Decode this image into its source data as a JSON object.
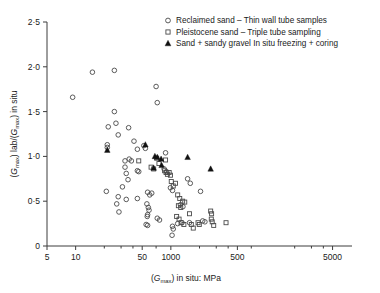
{
  "chart_data": {
    "type": "scatter",
    "title": "",
    "xlabel": "(Gmax) in situ: MPa",
    "ylabel": "(Gmax) lab/(Gmax) in situ",
    "xscale": "log",
    "yscale": "linear",
    "xlim": [
      5,
      8000
    ],
    "ylim": [
      0,
      2.5
    ],
    "grid": false,
    "legend_position": "top-right",
    "xticks_major": [
      {
        "value": 5,
        "label": "5"
      },
      {
        "value": 10,
        "label": "10"
      },
      {
        "value": 50,
        "label": "50"
      },
      {
        "value": 100,
        "label": "1000"
      },
      {
        "value": 500,
        "label": "500"
      },
      {
        "value": 5000,
        "label": "5000"
      }
    ],
    "xticks_minor": [
      20,
      30,
      40,
      70,
      200,
      300,
      400,
      700,
      2000,
      3000,
      4000
    ],
    "yticks": [
      {
        "value": 0,
        "label": "0"
      },
      {
        "value": 0.5,
        "label": "0·5"
      },
      {
        "value": 1.0,
        "label": "1·0"
      },
      {
        "value": 1.5,
        "label": "1·5"
      },
      {
        "value": 2.0,
        "label": "2·0"
      },
      {
        "value": 2.5,
        "label": "2·5"
      }
    ],
    "series": [
      {
        "name": "Reclaimed sand – Thin wall tube samples",
        "marker": "circle",
        "filled": false,
        "color": "#4a4a4a",
        "points": [
          [
            9.3,
            1.66
          ],
          [
            15.0,
            1.94
          ],
          [
            25.5,
            1.96
          ],
          [
            22.0,
            1.33
          ],
          [
            26.5,
            1.37
          ],
          [
            25.5,
            1.5
          ],
          [
            28.0,
            1.24
          ],
          [
            36.0,
            1.32
          ],
          [
            41.0,
            1.17
          ],
          [
            44.5,
            1.08
          ],
          [
            52.0,
            1.12
          ],
          [
            54.0,
            1.09
          ],
          [
            21.5,
            1.13
          ],
          [
            21.5,
            1.1
          ],
          [
            70.0,
            1.78
          ],
          [
            72.0,
            1.6
          ],
          [
            33.0,
            0.95
          ],
          [
            36.5,
            0.97
          ],
          [
            38.5,
            0.95
          ],
          [
            33.0,
            0.88
          ],
          [
            34.0,
            0.81
          ],
          [
            35.5,
            0.74
          ],
          [
            44.5,
            0.84
          ],
          [
            46.0,
            0.83
          ],
          [
            88.0,
            1.04
          ],
          [
            21.0,
            0.61
          ],
          [
            28.0,
            0.55
          ],
          [
            27.0,
            0.47
          ],
          [
            28.5,
            0.38
          ],
          [
            34.0,
            0.52
          ],
          [
            31.0,
            0.66
          ],
          [
            44.5,
            0.53
          ],
          [
            57.0,
            0.6
          ],
          [
            60.0,
            0.57
          ],
          [
            63.0,
            0.59
          ],
          [
            56.0,
            0.47
          ],
          [
            58.0,
            0.43
          ],
          [
            59.0,
            0.4
          ],
          [
            57.0,
            0.35
          ],
          [
            56.5,
            0.33
          ],
          [
            55.0,
            0.24
          ],
          [
            57.0,
            0.23
          ],
          [
            72.0,
            0.31
          ],
          [
            76.0,
            0.29
          ],
          [
            99.0,
            0.65
          ],
          [
            104.0,
            0.62
          ],
          [
            104.0,
            0.22
          ],
          [
            106.0,
            0.19
          ],
          [
            103.0,
            0.12
          ],
          [
            118.0,
            0.25
          ],
          [
            131.0,
            0.26
          ],
          [
            150.0,
            0.75
          ],
          [
            160.0,
            0.7
          ],
          [
            157.0,
            0.26
          ],
          [
            205.0,
            0.61
          ],
          [
            216.0,
            0.28
          ],
          [
            228.0,
            0.27
          ],
          [
            126.0,
            0.46
          ],
          [
            134.0,
            0.44
          ],
          [
            85.0,
            0.86
          ],
          [
            90.0,
            0.83
          ]
        ]
      },
      {
        "name": "Pleistocene sand – Triple tube sampling",
        "marker": "square",
        "filled": false,
        "color": "#4a4a4a",
        "points": [
          [
            46.0,
            0.95
          ],
          [
            62.0,
            0.88
          ],
          [
            66.0,
            0.86
          ],
          [
            88.0,
            0.96
          ],
          [
            86.0,
            0.84
          ],
          [
            89.0,
            0.82
          ],
          [
            92.0,
            0.8
          ],
          [
            96.0,
            0.82
          ],
          [
            99.0,
            0.79
          ],
          [
            101.0,
            0.72
          ],
          [
            106.0,
            0.67
          ],
          [
            112.0,
            0.7
          ],
          [
            118.0,
            0.57
          ],
          [
            124.0,
            0.53
          ],
          [
            120.0,
            0.45
          ],
          [
            127.0,
            0.43
          ],
          [
            133.0,
            0.5
          ],
          [
            140.0,
            0.49
          ],
          [
            115.0,
            0.33
          ],
          [
            122.0,
            0.3
          ],
          [
            128.0,
            0.26
          ],
          [
            137.0,
            0.24
          ],
          [
            157.0,
            0.36
          ],
          [
            164.0,
            0.24
          ],
          [
            172.0,
            0.2
          ],
          [
            193.0,
            0.26
          ],
          [
            199.0,
            0.24
          ],
          [
            262.0,
            0.39
          ],
          [
            268.0,
            0.36
          ],
          [
            266.0,
            0.3
          ],
          [
            272.0,
            0.27
          ],
          [
            282.0,
            0.23
          ],
          [
            380.0,
            0.26
          ],
          [
            71.0,
            0.98
          ],
          [
            75.0,
            0.92
          ]
        ]
      },
      {
        "name": "Sand + sandy gravel  In situ freezing + coring",
        "marker": "triangle",
        "filled": true,
        "color": "#111111",
        "points": [
          [
            21.5,
            1.07
          ],
          [
            54.0,
            1.13
          ],
          [
            68.0,
            1.0
          ],
          [
            72.0,
            0.99
          ],
          [
            79.0,
            0.97
          ],
          [
            80.0,
            0.9
          ],
          [
            66.0,
            0.87
          ],
          [
            150.0,
            0.99
          ],
          [
            262.0,
            0.86
          ]
        ]
      }
    ]
  },
  "axis": {
    "ylabel_pre": "(",
    "ylabel_g1": "G",
    "ylabel_sub1": "max",
    "ylabel_mid": ") lab/(",
    "ylabel_g2": "G",
    "ylabel_sub2": "max",
    "ylabel_post": ") in situ",
    "xlabel_pre": "(",
    "xlabel_g": "G",
    "xlabel_sub": "max",
    "xlabel_post": ") in situ: MPa"
  },
  "legend": {
    "items": [
      {
        "label": "Reclaimed sand – Thin wall tube samples",
        "marker": "circle"
      },
      {
        "label": "Pleistocene sand – Triple tube sampling",
        "marker": "square"
      },
      {
        "label": "Sand + sandy gravel  In situ freezing + coring",
        "marker": "triangle"
      }
    ]
  }
}
